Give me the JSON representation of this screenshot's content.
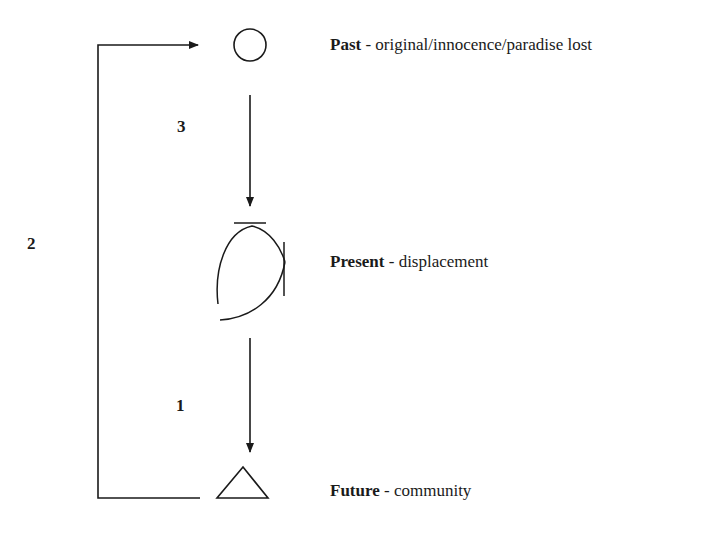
{
  "diagram": {
    "nodes": [
      {
        "id": "past",
        "shape": "circle",
        "title": "Past",
        "separator": " - ",
        "description": "original/innocence/paradise lost"
      },
      {
        "id": "present",
        "shape": "open-crossed-curve",
        "title": "Present",
        "separator": " - ",
        "description": "displacement"
      },
      {
        "id": "future",
        "shape": "triangle",
        "title": "Future",
        "separator": " - ",
        "description": "community"
      }
    ],
    "edges": [
      {
        "from": "present",
        "to": "future",
        "label": "1"
      },
      {
        "from": "future",
        "to": "past",
        "label": "2"
      },
      {
        "from": "past",
        "to": "present",
        "label": "3"
      }
    ],
    "stroke_color": "#1a1a1a"
  }
}
